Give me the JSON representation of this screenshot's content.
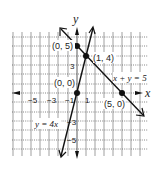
{
  "figure": {
    "axis_labels": {
      "x": "x",
      "y": "y"
    },
    "x_ticks": [
      "−5",
      "−3",
      "−1",
      "1"
    ],
    "y_ticks": [
      "3",
      "−3",
      "−5"
    ],
    "points": [
      {
        "label": "(0, 5)",
        "x": 0,
        "y": 5
      },
      {
        "label": "(1, 4)",
        "x": 1,
        "y": 4
      },
      {
        "label": "(0, 0)",
        "x": 0,
        "y": 0
      },
      {
        "label": "(5, 0)",
        "x": 5,
        "y": 0
      }
    ],
    "lines": [
      {
        "label": "x + y = 5",
        "equation": "x + y = 5"
      },
      {
        "label": "y = 4x",
        "equation": "y = 4x"
      }
    ],
    "colors": {
      "line": "#222222",
      "grid": "#555555",
      "point": "#111111"
    }
  }
}
